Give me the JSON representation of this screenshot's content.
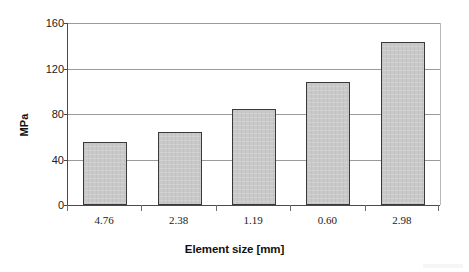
{
  "chart_data": {
    "type": "bar",
    "title": "",
    "xlabel": "Element size [mm]",
    "ylabel": "MPa",
    "categories": [
      "4.76",
      "2.38",
      "1.19",
      "0.60",
      "2.98"
    ],
    "values": [
      55,
      64,
      84.5,
      108,
      143
    ],
    "ylim": [
      0,
      160
    ],
    "yticks": [
      "0",
      "40",
      "80",
      "120",
      "160"
    ],
    "ytick_values": [
      0,
      40,
      80,
      120,
      160
    ],
    "grid": true,
    "legend": "none",
    "bar_fill_color": "#c9c9c9",
    "bar_border_color": "#3a3a3a",
    "grid_color": "#9a9a9a",
    "axis_color": "#4a4a4a",
    "background_color": "#ffffff"
  }
}
